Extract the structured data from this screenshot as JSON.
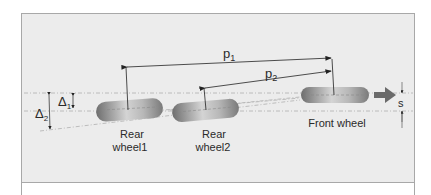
{
  "diagram": {
    "labels": {
      "p1": "p",
      "p1_sub": "1",
      "p2": "p",
      "p2_sub": "2",
      "delta1": "Δ",
      "delta1_sub": "1",
      "delta2": "Δ",
      "delta2_sub": "2",
      "s": "s",
      "rear_wheel1_line1": "Rear",
      "rear_wheel1_line2": "wheel1",
      "rear_wheel2_line1": "Rear",
      "rear_wheel2_line2": "wheel2",
      "front_wheel": "Front wheel"
    },
    "nodes": [
      {
        "id": "rear-wheel-1",
        "label": "Rear wheel1"
      },
      {
        "id": "rear-wheel-2",
        "label": "Rear wheel2"
      },
      {
        "id": "front-wheel",
        "label": "Front wheel"
      }
    ],
    "dimensions": [
      {
        "id": "p1",
        "from": "rear-wheel-1",
        "to": "front-wheel",
        "label": "p1"
      },
      {
        "id": "p2",
        "from": "rear-wheel-2",
        "to": "front-wheel",
        "label": "p2"
      },
      {
        "id": "delta1",
        "label": "Δ1",
        "meaning": "lateral offset rear wheel1"
      },
      {
        "id": "delta2",
        "label": "Δ2",
        "meaning": "lateral offset extended line"
      },
      {
        "id": "s",
        "label": "s",
        "meaning": "front wheel lateral offset"
      }
    ],
    "direction": "right",
    "colors": {
      "panel_bg": "#ececec",
      "border": "#a8a8a8",
      "wheel_dark": "#6e6e6e",
      "wheel_light": "#d0d0d0",
      "line": "#2a2a2a",
      "dash": "#b0b0b0"
    }
  }
}
